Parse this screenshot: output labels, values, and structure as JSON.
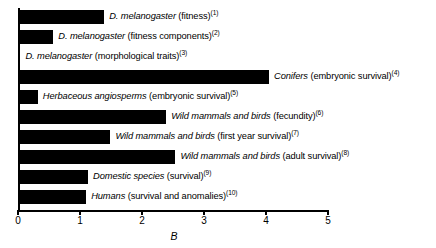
{
  "chart_data": {
    "type": "bar",
    "orientation": "horizontal",
    "title": "",
    "xlabel": "B",
    "ylabel": "",
    "xlim": [
      0,
      5
    ],
    "xticks": [
      0,
      1,
      2,
      3,
      4,
      5
    ],
    "xtick_labels": [
      "0",
      "1",
      "2",
      "3",
      "4",
      "5"
    ],
    "grid": false,
    "legend": null,
    "bar_color": "#000000",
    "categories": [
      "D. melanogaster (fitness)",
      "D. melanogaster (fitness components)",
      "D. melanogaster (morphological traits)",
      "Conifers (embryonic survival)",
      "Herbaceous angiosperms (embryonic survival)",
      "Wild mammals and birds (fecundity)",
      "Wild mammals and birds (first year survival)",
      "Wild mammals and birds (adult survival)",
      "Domestic species (survival)",
      "Humans (survival and anomalies)"
    ],
    "values": [
      1.39,
      0.57,
      0.04,
      4.05,
      0.32,
      2.39,
      1.49,
      2.54,
      1.13,
      1.1
    ],
    "bars": [
      {
        "italic_part": "D. melanogaster",
        "rest": " (fitness)",
        "ref": "(1)",
        "value": 1.39
      },
      {
        "italic_part": "D. melanogaster",
        "rest": " (fitness components)",
        "ref": "(2)",
        "value": 0.57
      },
      {
        "italic_part": "D. melanogaster",
        "rest": " (morphological traits)",
        "ref": "(3)",
        "value": 0.04
      },
      {
        "italic_part": "Conifers",
        "rest": " (embryonic survival)",
        "ref": "(4)",
        "value": 4.05
      },
      {
        "italic_part": "Herbaceous angiosperms",
        "rest": " (embryonic survival)",
        "ref": "(5)",
        "value": 0.32
      },
      {
        "italic_part": "Wild mammals and birds",
        "rest": " (fecundity)",
        "ref": "(6)",
        "value": 2.39
      },
      {
        "italic_part": "Wild mammals and birds",
        "rest": " (first year survival)",
        "ref": "(7)",
        "value": 1.49
      },
      {
        "italic_part": "Wild mammals and birds",
        "rest": " (adult survival)",
        "ref": "(8)",
        "value": 2.54
      },
      {
        "italic_part": "Domestic species",
        "rest": " (survival)",
        "ref": "(9)",
        "value": 1.13
      },
      {
        "italic_part": "Humans",
        "rest": " (survival and anomalies)",
        "ref": "(10)",
        "value": 1.1
      }
    ]
  },
  "layout": {
    "origin_x_px": 18,
    "px_per_unit": 62,
    "bar_height_px": 14,
    "row_pitch_px": 20,
    "first_row_top_px": 10
  }
}
